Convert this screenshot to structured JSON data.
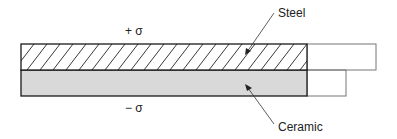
{
  "diagram": {
    "labels": {
      "steel": "Steel",
      "ceramic": "Ceramic",
      "tension": "+ σ",
      "compression": "− σ"
    },
    "colors": {
      "outline": "#1a1a1a",
      "ceramic_fill": "#d9d9d9",
      "hatch": "#222222",
      "extension_outline": "#777777"
    }
  }
}
